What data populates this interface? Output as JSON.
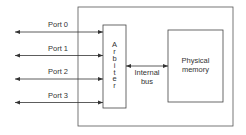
{
  "diagram": {
    "ports": [
      {
        "label": "Port 0"
      },
      {
        "label": "Port 1"
      },
      {
        "label": "Port 2"
      },
      {
        "label": "Port 3"
      }
    ],
    "arbiter": {
      "label": "Arbiter",
      "letters": [
        "A",
        "r",
        "b",
        "i",
        "t",
        "e",
        "r"
      ]
    },
    "internal_bus": {
      "line1": "Internal",
      "line2": "bus"
    },
    "physical_memory": {
      "line1": "Physical",
      "line2": "memory"
    },
    "colors": {
      "stroke": "#333333",
      "background": "#ffffff"
    }
  }
}
